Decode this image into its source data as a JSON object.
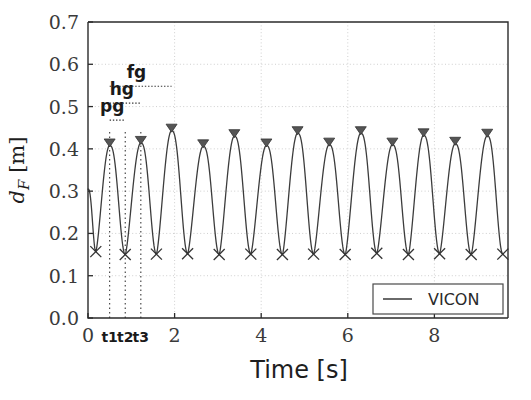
{
  "chart_data": {
    "type": "line",
    "title": "",
    "xlabel": "Time [s]",
    "ylabel": "d_F [m]",
    "ylabel_parts": {
      "symbol": "d",
      "subscript": "F",
      "unit": "[m]"
    },
    "xlim": [
      0,
      9.7
    ],
    "ylim": [
      0.0,
      0.7
    ],
    "xticks": [
      0,
      2,
      4,
      6,
      8
    ],
    "xticklabels": [
      "0",
      "2",
      "4",
      "6",
      "8"
    ],
    "yticks": [
      0.0,
      0.1,
      0.2,
      0.3,
      0.4,
      0.5,
      0.6,
      0.7
    ],
    "yticklabels": [
      "0.0",
      "0.1",
      "0.2",
      "0.3",
      "0.4",
      "0.5",
      "0.6",
      "0.7"
    ],
    "grid": true,
    "legend": {
      "position": "lower right",
      "entries": [
        {
          "label": "VICON",
          "marker": "line",
          "color": "#444444"
        }
      ]
    },
    "series": [
      {
        "name": "VICON",
        "color": "#3c3c3c",
        "peaks": {
          "marker": "triangle-down",
          "x": [
            0.5,
            1.22,
            1.93,
            2.66,
            3.38,
            4.12,
            4.84,
            5.57,
            6.3,
            7.03,
            7.75,
            8.48,
            9.22
          ],
          "y": [
            0.408,
            0.414,
            0.443,
            0.406,
            0.43,
            0.408,
            0.437,
            0.41,
            0.437,
            0.41,
            0.432,
            0.412,
            0.431
          ]
        },
        "valleys": {
          "marker": "x",
          "x": [
            0.18,
            0.86,
            1.58,
            2.3,
            3.03,
            3.76,
            4.49,
            5.21,
            5.94,
            6.67,
            7.4,
            8.12,
            8.85,
            9.58
          ],
          "y": [
            0.157,
            0.15,
            0.151,
            0.152,
            0.15,
            0.151,
            0.15,
            0.151,
            0.15,
            0.153,
            0.15,
            0.152,
            0.15,
            0.151
          ]
        },
        "start_point": {
          "x": 0.0,
          "y": 0.305
        }
      }
    ],
    "annotations": [
      {
        "name": "pg",
        "label": "pg",
        "from_x": 0.5,
        "to_x": 0.86,
        "y": 0.468,
        "label_x": 0.56,
        "label_y": 0.487
      },
      {
        "name": "hg",
        "label": "hg",
        "from_x": 0.5,
        "to_x": 1.22,
        "y": 0.508,
        "label_x": 0.78,
        "label_y": 0.527
      },
      {
        "name": "fg",
        "label": "fg",
        "from_x": 0.5,
        "to_x": 1.93,
        "y": 0.548,
        "label_x": 1.12,
        "label_y": 0.567
      }
    ],
    "event_markers": [
      {
        "name": "t1",
        "label": "t1",
        "x": 0.5
      },
      {
        "name": "t2",
        "label": "t2",
        "x": 0.86
      },
      {
        "name": "t3",
        "label": "t3",
        "x": 1.22
      }
    ],
    "colors": {
      "line": "#3c3c3c",
      "axis": "#2b2b2b",
      "grid": "#c9c9c9",
      "text": "#1e1e1e",
      "marker": "#555555",
      "background": "#ffffff"
    }
  }
}
